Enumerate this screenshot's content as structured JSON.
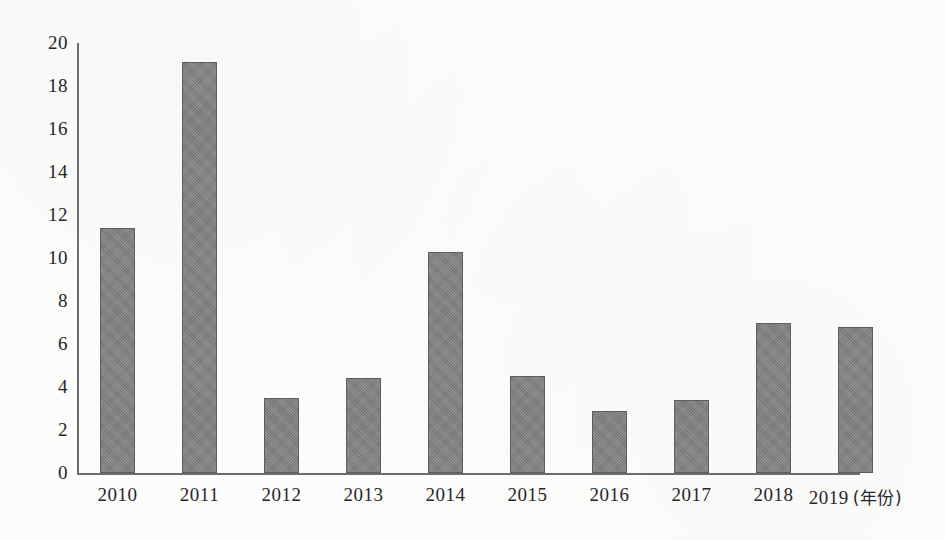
{
  "chart_data": {
    "type": "bar",
    "title": "",
    "subtitle": "",
    "xlabel": "年份",
    "ylabel": "",
    "xlabel_display": "(年份)",
    "categories": [
      "2010",
      "2011",
      "2012",
      "2013",
      "2014",
      "2015",
      "2016",
      "2017",
      "2018",
      "2019"
    ],
    "values": [
      11.4,
      19.1,
      3.5,
      4.4,
      10.3,
      4.5,
      2.9,
      3.4,
      7.0,
      6.8
    ],
    "series": [
      {
        "name": "",
        "values": [
          11.4,
          19.1,
          3.5,
          4.4,
          10.3,
          4.5,
          2.9,
          3.4,
          7.0,
          6.8
        ]
      }
    ],
    "ylim": [
      0,
      20
    ],
    "ytick_step": 2,
    "ytick_labels": [
      "0",
      "2",
      "4",
      "6",
      "8",
      "10",
      "12",
      "14",
      "16",
      "18",
      "20"
    ],
    "xtick_labels": [
      "2010",
      "2011",
      "2012",
      "2013",
      "2014",
      "2015",
      "2016",
      "2017",
      "2018",
      "2019 (年份)"
    ],
    "grid": false,
    "legend": [],
    "legend_position": "none",
    "annotations": [],
    "colors": {
      "bar_fill": "#7e7e7e",
      "bar_border": "#5d5d5d",
      "axis": "#6c6c6c",
      "text": "#26262a",
      "background": "#fcfcfa"
    }
  }
}
